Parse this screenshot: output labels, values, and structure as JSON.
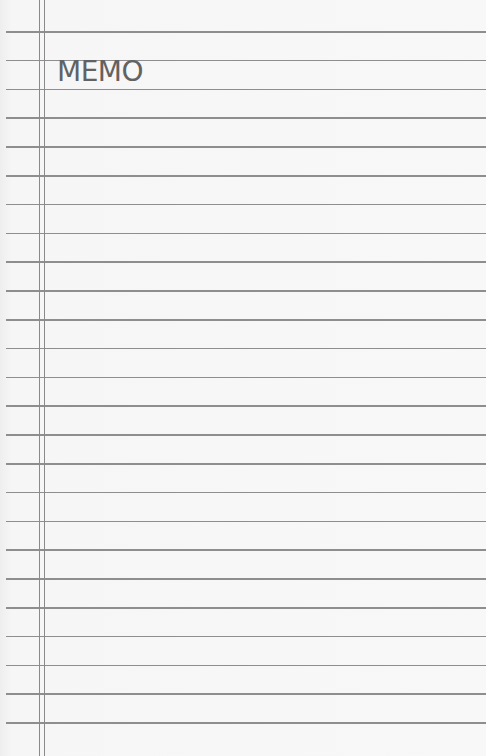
{
  "memo": {
    "title": "MEMO",
    "line_count": 25,
    "first_line_y": 31,
    "line_spacing": 28.8,
    "margin_lines_x": [
      39,
      44
    ],
    "colors": {
      "paper": "#f7f7f7",
      "rule": "#8e8e8e",
      "title": "#626262"
    }
  }
}
